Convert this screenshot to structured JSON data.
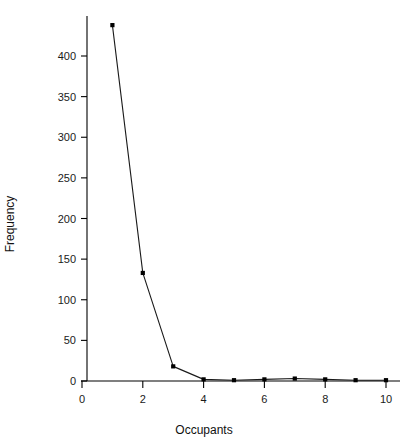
{
  "chart_data": {
    "type": "line",
    "title": "",
    "xlabel": "Occupants",
    "ylabel": "Frequency",
    "x": [
      1,
      2,
      3,
      4,
      5,
      6,
      7,
      8,
      9,
      10
    ],
    "values": [
      438,
      133,
      18,
      2,
      1,
      2,
      3,
      2,
      1,
      1
    ],
    "series": [
      {
        "name": "Frequency",
        "x": [
          1,
          2,
          3,
          4,
          5,
          6,
          7,
          8,
          9,
          10
        ],
        "values": [
          438,
          133,
          18,
          2,
          1,
          2,
          3,
          2,
          1,
          1
        ]
      }
    ],
    "xlim": [
      0,
      10.4
    ],
    "ylim": [
      0,
      450
    ],
    "xticks": [
      0,
      2,
      4,
      6,
      8,
      10
    ],
    "yticks": [
      0,
      50,
      100,
      150,
      200,
      250,
      300,
      350,
      400
    ],
    "xtick_labels": [
      "0",
      "2",
      "4",
      "6",
      "8",
      "10"
    ],
    "ytick_labels": [
      "0",
      "50",
      "100",
      "150",
      "200",
      "250",
      "300",
      "350",
      "400"
    ],
    "grid": false,
    "legend": null,
    "marker": "square",
    "line_color": "#1a1a1a",
    "marker_color": "#000000",
    "axis_color": "#000000",
    "background_color": "#ffffff"
  }
}
